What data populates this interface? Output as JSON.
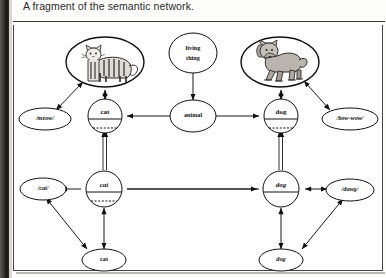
{
  "caption": {
    "text": "A fragment of the semantic network."
  },
  "figure": {
    "colors": {
      "ink": "#111111",
      "paper": "#fefefe",
      "rule": "#3a3a3a",
      "gutter": "#201e1a"
    }
  },
  "nodes": {
    "living_thing": {
      "label_line1": "living",
      "label_line2": "thing",
      "type": "concept-ellipse"
    },
    "animal": {
      "label": "animal",
      "type": "concept-ellipse"
    },
    "cat_picture": {
      "label": "cat-illustration",
      "type": "image-ellipse"
    },
    "dog_picture": {
      "label": "dog-illustration",
      "type": "image-ellipse"
    },
    "meow": {
      "label": "/meow/",
      "type": "phoneme-ellipse"
    },
    "bow_wow": {
      "label": "/bow-wow/",
      "type": "phoneme-ellipse"
    },
    "cat_concept": {
      "label": "cat",
      "type": "split-circle"
    },
    "dog_concept": {
      "label": "dog",
      "type": "split-circle"
    },
    "cat_lexeme": {
      "label": "cat",
      "type": "split-circle-italic"
    },
    "dog_lexeme": {
      "label": "dog",
      "type": "split-circle-italic"
    },
    "cat_phon": {
      "label": "/cat/",
      "type": "phoneme-ellipse"
    },
    "dog_phon": {
      "label": "/dawg/",
      "type": "phoneme-ellipse"
    },
    "cat_word": {
      "label": "cat",
      "type": "word-ellipse"
    },
    "dog_word": {
      "label": "dog",
      "type": "word-ellipse"
    }
  },
  "edges": [
    {
      "from": "living_thing",
      "to": "animal",
      "arrow": "single"
    },
    {
      "from": "animal",
      "to": "cat_concept",
      "arrow": "single"
    },
    {
      "from": "animal",
      "to": "dog_concept",
      "arrow": "single"
    },
    {
      "from": "cat_concept",
      "to": "cat_picture",
      "arrow": "double"
    },
    {
      "from": "dog_concept",
      "to": "dog_picture",
      "arrow": "double"
    },
    {
      "from": "meow",
      "to": "cat_picture",
      "arrow": "double"
    },
    {
      "from": "bow_wow",
      "to": "dog_picture",
      "arrow": "double"
    },
    {
      "from": "cat_concept",
      "to": "cat_lexeme",
      "arrow": "double-line"
    },
    {
      "from": "dog_concept",
      "to": "dog_lexeme",
      "arrow": "double-line"
    },
    {
      "from": "cat_lexeme",
      "to": "dog_lexeme",
      "arrow": "none"
    },
    {
      "from": "cat_lexeme",
      "to": "cat_phon",
      "arrow": "single"
    },
    {
      "from": "dog_lexeme",
      "to": "dog_phon",
      "arrow": "double"
    },
    {
      "from": "cat_lexeme",
      "to": "cat_word",
      "arrow": "double"
    },
    {
      "from": "dog_lexeme",
      "to": "dog_word",
      "arrow": "double"
    },
    {
      "from": "cat_phon",
      "to": "cat_word",
      "arrow": "double"
    },
    {
      "from": "dog_phon",
      "to": "dog_word",
      "arrow": "double"
    }
  ]
}
